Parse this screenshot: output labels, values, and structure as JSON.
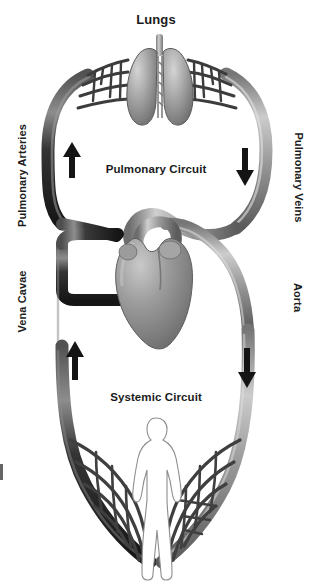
{
  "diagram": {
    "title": "Lungs",
    "background_color": "#ffffff",
    "text_color": "#1b1b1b"
  },
  "labels": {
    "lungs": "Lungs",
    "pulmonary_circuit": "Pulmonary Circuit",
    "systemic_circuit": "Systemic Circuit",
    "pulmonary_arteries": "Pulmonary Arteries",
    "pulmonary_veins": "Pulmonary Veins",
    "vena_cavae": "Vena Cavae",
    "aorta": "Aorta"
  },
  "organs": [
    {
      "name": "lungs",
      "label": "Lungs",
      "fill": "#9a9a9a"
    },
    {
      "name": "heart",
      "label": "Heart",
      "fill": "#8f8f8f"
    },
    {
      "name": "body",
      "label": "Human body silhouette",
      "fill": "#ffffff"
    }
  ],
  "vessels": [
    {
      "name": "pulmonary-arteries",
      "label": "Pulmonary Arteries",
      "side": "left",
      "circuit": "pulmonary",
      "color": "#2c2c2c",
      "flow": "up"
    },
    {
      "name": "pulmonary-veins",
      "label": "Pulmonary Veins",
      "side": "right",
      "circuit": "pulmonary",
      "color": "#8b8b8b",
      "flow": "down"
    },
    {
      "name": "vena-cavae",
      "label": "Vena Cavae",
      "side": "left",
      "circuit": "systemic",
      "color": "#2c2c2c",
      "flow": "up"
    },
    {
      "name": "aorta",
      "label": "Aorta",
      "side": "right",
      "circuit": "systemic",
      "color": "#8b8b8b",
      "flow": "down"
    }
  ],
  "flow_arrows": [
    {
      "name": "pulmonary-left-arrow",
      "direction": "up",
      "circuit": "pulmonary",
      "color": "#141414"
    },
    {
      "name": "pulmonary-right-arrow",
      "direction": "down",
      "circuit": "pulmonary",
      "color": "#141414"
    },
    {
      "name": "systemic-left-arrow",
      "direction": "up",
      "circuit": "systemic",
      "color": "#141414"
    },
    {
      "name": "systemic-right-arrow",
      "direction": "down",
      "circuit": "systemic",
      "color": "#141414"
    }
  ],
  "capillary_beds": [
    {
      "name": "pulmonary-capillary-bed",
      "location": "lungs"
    },
    {
      "name": "systemic-capillary-bed",
      "location": "body"
    }
  ],
  "colors": {
    "deoxygenated": "#2c2c2c",
    "oxygenated": "#8b8b8b",
    "organ": "#9a9a9a",
    "text": "#1b1b1b",
    "background": "#ffffff"
  }
}
